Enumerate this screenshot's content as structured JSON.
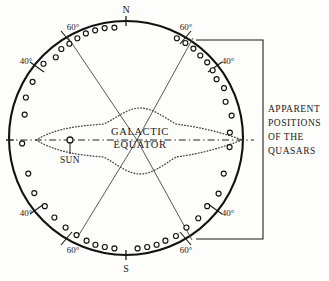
{
  "figure": {
    "background_color": "#fdfdfb",
    "ink_color": "#1a1a1a"
  },
  "sphere": {
    "center_x": 126,
    "center_y": 138,
    "radius": 117,
    "stroke_color": "#111111"
  },
  "cardinal_labels": [
    {
      "name": "north",
      "text": "N",
      "x": 126,
      "y": 14
    },
    {
      "name": "south",
      "text": "S",
      "x": 126,
      "y": 270
    }
  ],
  "latitude_labels": [
    {
      "name": "upper-left-60",
      "text": "60°",
      "x": 73,
      "y": 30,
      "angle_deg": 60
    },
    {
      "name": "upper-right-60",
      "text": "60°",
      "x": 186,
      "y": 30,
      "angle_deg": 60
    },
    {
      "name": "upper-left-40",
      "text": "40°",
      "x": 26,
      "y": 64,
      "angle_deg": 40
    },
    {
      "name": "upper-right-40",
      "text": "40°",
      "x": 228,
      "y": 64,
      "angle_deg": 40
    },
    {
      "name": "lower-left-40",
      "text": "40°",
      "x": 26,
      "y": 216,
      "angle_deg": 40
    },
    {
      "name": "lower-right-40",
      "text": "40°",
      "x": 228,
      "y": 216,
      "angle_deg": 40
    },
    {
      "name": "lower-left-60",
      "text": "60°",
      "x": 73,
      "y": 253,
      "angle_deg": 60
    },
    {
      "name": "lower-right-60",
      "text": "60°",
      "x": 186,
      "y": 253,
      "angle_deg": 60
    }
  ],
  "galaxy": {
    "label_line_1": "GALACTIC",
    "label_line_2": "EQUATOR",
    "label_x": 140,
    "label_y_1": 135,
    "label_y_2": 148,
    "dot_color": "#3a3a3a"
  },
  "sun": {
    "label": "SUN",
    "marker_x": 70,
    "marker_y": 140,
    "marker_radius": 3,
    "label_x": 70,
    "label_y": 162
  },
  "bracket": {
    "line_1": "APPARENT",
    "line_2": "POSITIONS",
    "line_3": "OF  THE",
    "line_4": "QUASARS",
    "x": 268,
    "y_1": 112,
    "y_2": 126,
    "y_3": 140,
    "y_4": 154,
    "spine_x": 263,
    "top_y": 40,
    "bottom_y": 239,
    "arm_left_top_x": 196,
    "arm_left_bottom_x": 196
  },
  "chart_data": {
    "type": "scatter",
    "title": "Apparent positions of the quasars",
    "projection": "celestial sphere, galactic coordinates",
    "xlabel": "",
    "ylabel": "",
    "annotations": [
      "N",
      "S",
      "GALACTIC EQUATOR",
      "SUN",
      "APPARENT POSITIONS OF THE QUASARS"
    ],
    "latitude_ticks_deg": [
      40,
      60
    ],
    "grid": false,
    "legend": "none",
    "series": [
      {
        "name": "quasars",
        "marker": "open-circle",
        "points_polar_deg": [
          {
            "angle": 96,
            "r": 111
          },
          {
            "angle": 101,
            "r": 112
          },
          {
            "angle": 106,
            "r": 112
          },
          {
            "angle": 111,
            "r": 112
          },
          {
            "angle": 116,
            "r": 111
          },
          {
            "angle": 121,
            "r": 110
          },
          {
            "angle": 126,
            "r": 110
          },
          {
            "angle": 131,
            "r": 107
          },
          {
            "angle": 138,
            "r": 111
          },
          {
            "angle": 149,
            "r": 109
          },
          {
            "angle": 158,
            "r": 108
          },
          {
            "angle": 167,
            "r": 104
          },
          {
            "angle": 183,
            "r": 104
          },
          {
            "angle": 63,
            "r": 112
          },
          {
            "angle": 58,
            "r": 112
          },
          {
            "angle": 53,
            "r": 112
          },
          {
            "angle": 48,
            "r": 111
          },
          {
            "angle": 43,
            "r": 111
          },
          {
            "angle": 38,
            "r": 110
          },
          {
            "angle": 33,
            "r": 108
          },
          {
            "angle": 27,
            "r": 110
          },
          {
            "angle": 20,
            "r": 106
          },
          {
            "angle": 12,
            "r": 108
          },
          {
            "angle": 3,
            "r": 104
          },
          {
            "angle": 276,
            "r": 111
          },
          {
            "angle": 281,
            "r": 111
          },
          {
            "angle": 286,
            "r": 111
          },
          {
            "angle": 291,
            "r": 110
          },
          {
            "angle": 297,
            "r": 110
          },
          {
            "angle": 304,
            "r": 108
          },
          {
            "angle": 312,
            "r": 108
          },
          {
            "angle": 320,
            "r": 106
          },
          {
            "angle": 329,
            "r": 108
          },
          {
            "angle": 340,
            "r": 104
          },
          {
            "angle": 355,
            "r": 104
          },
          {
            "angle": 264,
            "r": 111
          },
          {
            "angle": 259,
            "r": 111
          },
          {
            "angle": 254,
            "r": 111
          },
          {
            "angle": 249,
            "r": 110
          },
          {
            "angle": 243,
            "r": 109
          },
          {
            "angle": 236,
            "r": 108
          },
          {
            "angle": 228,
            "r": 107
          },
          {
            "angle": 220,
            "r": 106
          },
          {
            "angle": 211,
            "r": 107
          },
          {
            "angle": 200,
            "r": 104
          }
        ]
      }
    ]
  }
}
